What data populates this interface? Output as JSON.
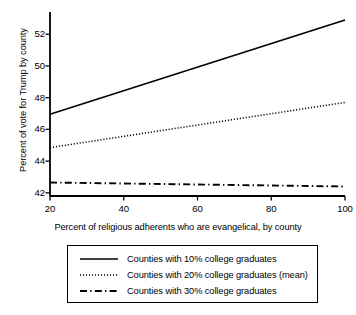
{
  "chart_data": {
    "type": "line",
    "title": "",
    "xlabel": "Percent of religious adherents who are evangelical, by county",
    "ylabel": "Percent of vote for Trump by county",
    "xlim": [
      20,
      100
    ],
    "ylim": [
      41.8,
      53.4
    ],
    "xticks": [
      20,
      40,
      60,
      80,
      100
    ],
    "xtick_labels": [
      "20",
      "40",
      "60",
      "80",
      "100"
    ],
    "yticks": [
      42,
      44,
      46,
      48,
      50,
      52
    ],
    "ytick_labels": [
      "42",
      "44",
      "46",
      "48",
      "50",
      "52"
    ],
    "grid": false,
    "legend_position": "below-axes",
    "x": [
      20,
      100
    ],
    "series": [
      {
        "name": "Counties with 10% college graduates",
        "linestyle": "solid",
        "color": "#000000",
        "values": [
          46.95,
          52.9
        ]
      },
      {
        "name": "Counties with 20% college graduates (mean)",
        "linestyle": "dotted",
        "color": "#000000",
        "values": [
          44.85,
          47.7
        ]
      },
      {
        "name": "Counties with 30% college graduates",
        "linestyle": "dashdot",
        "color": "#000000",
        "values": [
          42.65,
          42.4
        ]
      }
    ]
  },
  "legend": {
    "entries": [
      {
        "label": "Counties with 10% college graduates"
      },
      {
        "label": "Counties with 20% college graduates (mean)"
      },
      {
        "label": "Counties with 30% college graduates"
      }
    ]
  }
}
